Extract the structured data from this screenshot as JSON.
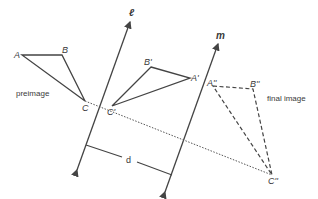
{
  "diagram": {
    "type": "translation-by-reflection-over-two-parallel-lines",
    "lines": {
      "l": {
        "label": "ℓ"
      },
      "m": {
        "label": "m"
      }
    },
    "preimage": {
      "caption": "preimage",
      "vertices": {
        "A": "A",
        "B": "B",
        "C": "C"
      }
    },
    "first_image": {
      "vertices": {
        "A": "A'",
        "B": "B'",
        "C": "C'"
      }
    },
    "final_image": {
      "caption": "final image",
      "vertices": {
        "A": "A''",
        "B": "B''",
        "C": "C''"
      }
    },
    "distance_label": "d",
    "colors": {
      "stroke": "#444444",
      "text": "#3a3a3a",
      "background": "#ffffff"
    }
  }
}
